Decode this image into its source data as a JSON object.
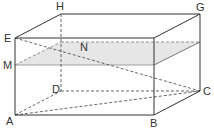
{
  "figure": {
    "type": "rectangular-prism",
    "vertices": {
      "A": {
        "label": "A",
        "x": 15,
        "y": 115
      },
      "B": {
        "label": "B",
        "x": 154,
        "y": 115
      },
      "C": {
        "label": "C",
        "x": 200,
        "y": 91
      },
      "D": {
        "label": "D",
        "x": 61,
        "y": 91
      },
      "E": {
        "label": "E",
        "x": 15,
        "y": 38
      },
      "F": {
        "label": "",
        "x": 154,
        "y": 38
      },
      "G": {
        "label": "G",
        "x": 200,
        "y": 14
      },
      "H": {
        "label": "H",
        "x": 61,
        "y": 14
      },
      "M": {
        "label": "M",
        "x": 15,
        "y": 65
      },
      "N": {
        "label": "N",
        "x": 85,
        "y": 49
      }
    },
    "labels": {
      "A": "A",
      "B": "B",
      "C": "C",
      "D": "D",
      "E": "E",
      "G": "G",
      "H": "H",
      "M": "M",
      "N": "N"
    },
    "section_plane": {
      "points": [
        "M",
        "front-right",
        "back-right",
        "back-left"
      ],
      "fill": "#e6e6e6"
    },
    "colors": {
      "edge": "#333333",
      "hidden": "#555555",
      "plane_fill": "#e6e6e6",
      "label": "#333333"
    }
  }
}
